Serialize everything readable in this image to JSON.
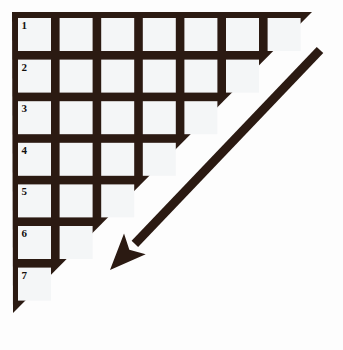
{
  "figure": {
    "kind": "staircase-triangle-diagram",
    "background_color": "#fdfdfd",
    "fill_color": "#2b1a12",
    "cell_color": "#f4f6f7",
    "label_color": "#13100e",
    "triangle": {
      "apex_top_left": [
        12,
        12
      ],
      "apex_top_right": [
        312,
        12
      ],
      "apex_bottom_left": [
        13,
        313
      ]
    },
    "grid": {
      "origin_x": 18,
      "origin_y": 18,
      "pitch": 41.6,
      "cell_size": 33,
      "row_count": 7,
      "cells_per_row": [
        7,
        6,
        5,
        4,
        3,
        2,
        1
      ],
      "total_cells": 28
    },
    "rows": [
      {
        "label": "1",
        "cells": 7
      },
      {
        "label": "2",
        "cells": 6
      },
      {
        "label": "3",
        "cells": 5
      },
      {
        "label": "4",
        "cells": 4
      },
      {
        "label": "5",
        "cells": 3
      },
      {
        "label": "6",
        "cells": 2
      },
      {
        "label": "7",
        "cells": 1
      }
    ],
    "arrow": {
      "name": "down-left-arrow",
      "direction": "down-left",
      "tail": [
        320,
        50
      ],
      "tip": [
        110,
        270
      ],
      "shaft_thickness": 9,
      "head_length": 36,
      "head_width": 30,
      "color": "#2b1a12"
    }
  }
}
